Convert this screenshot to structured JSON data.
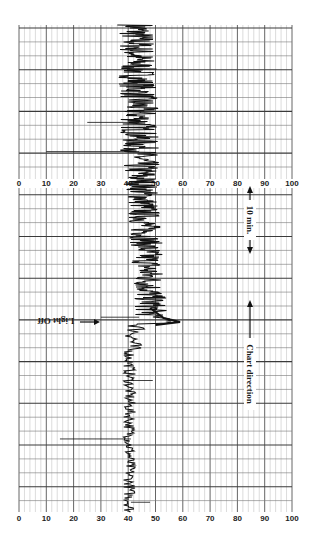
{
  "chart_data": {
    "type": "line",
    "title": "",
    "xlabel": "",
    "ylabel": "",
    "scale": {
      "ticks": [
        0,
        10,
        20,
        30,
        40,
        50,
        60,
        70,
        80,
        90,
        100
      ],
      "tick_labels": [
        "0",
        "10",
        "20",
        "30",
        "40",
        "50",
        "60",
        "70",
        "80",
        "90",
        "100"
      ],
      "range": [
        0,
        100
      ],
      "minor_step": 2,
      "major_step": 10
    },
    "grid": true,
    "annotations": [
      {
        "text": "Light Off",
        "arrow": "right",
        "position": "left of trace at light-off event"
      },
      {
        "text": "10 min.",
        "arrow": "both",
        "position": "right margin, upper half"
      },
      {
        "text": "Chart direction",
        "arrow": "up",
        "position": "right margin, lower half"
      }
    ],
    "segments": [
      {
        "name": "Light on (early)",
        "baseline": 44,
        "range": [
          36,
          52
        ],
        "noise": "high"
      },
      {
        "name": "Light on (late)",
        "baseline": 48,
        "range": [
          40,
          56
        ],
        "noise": "high"
      },
      {
        "name": "Light off transient",
        "peak": 59
      },
      {
        "name": "Dark",
        "baseline": 40,
        "range": [
          38,
          47
        ],
        "noise": "low"
      }
    ],
    "spikes": [
      {
        "position_fraction": 0.2,
        "to_value": 25
      },
      {
        "position_fraction": 0.26,
        "to_value": 10
      },
      {
        "position_fraction": 0.6,
        "to_value": 30
      },
      {
        "position_fraction": 0.73,
        "to_value": 49
      },
      {
        "position_fraction": 0.85,
        "to_value": 15
      },
      {
        "position_fraction": 0.98,
        "to_value": 48
      }
    ]
  },
  "labels": {
    "light_off": "Light Off",
    "ten_min": "10 min.",
    "chart_direction": "Chart direction"
  },
  "colors": {
    "grid_minor": "#b8b8b8",
    "grid_major": "#555555",
    "trace": "#111111",
    "paper": "#ffffff"
  }
}
